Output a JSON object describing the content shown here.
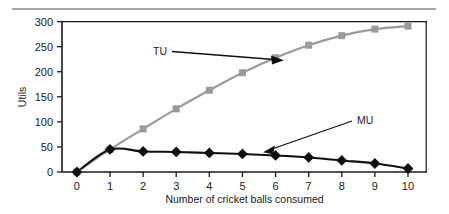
{
  "figure": {
    "top_rule": true,
    "background": "#ffffff"
  },
  "chart_data": {
    "type": "line",
    "title": "",
    "xlabel": "Number of cricket balls consumed",
    "ylabel": "Utils",
    "x": [
      0,
      1,
      2,
      3,
      4,
      5,
      6,
      7,
      8,
      9,
      10
    ],
    "xticklabels": [
      "0",
      "1",
      "2",
      "3",
      "4",
      "5",
      "6",
      "7",
      "8",
      "9",
      "10"
    ],
    "yticks": [
      0,
      50,
      100,
      150,
      200,
      250,
      300
    ],
    "yticklabels": [
      "0",
      "50",
      "100",
      "150",
      "200",
      "250",
      "300"
    ],
    "xlim": [
      -0.45,
      10.55
    ],
    "ylim": [
      0,
      300
    ],
    "grid": false,
    "legend": "inline-annotations",
    "series": [
      {
        "name": "TU",
        "label": "TU",
        "color": "#9a9a9a",
        "marker": "square",
        "values": [
          0,
          45,
          86,
          126,
          163,
          198,
          228,
          253,
          272,
          285,
          291
        ]
      },
      {
        "name": "MU",
        "label": "MU",
        "color": "#101010",
        "marker": "diamond",
        "values": [
          0,
          45,
          41,
          40,
          38,
          36,
          33,
          29,
          23,
          17,
          7
        ]
      }
    ],
    "annotations": [
      {
        "text": "TU",
        "target_x": 6,
        "target_y": 228,
        "arrow": "right"
      },
      {
        "text": "MU",
        "target_x": 5.55,
        "target_y": 35,
        "arrow": "down-left"
      }
    ]
  }
}
